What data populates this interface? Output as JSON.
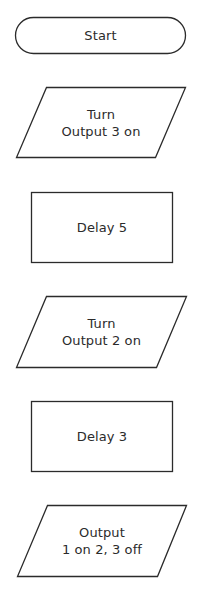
{
  "diagram": {
    "type": "flowchart",
    "stroke_color": "#2b2b2b",
    "text_color": "#2b2b2b",
    "background": "#ffffff",
    "nodes": [
      {
        "id": "start",
        "shape": "terminator",
        "lines": [
          "Start"
        ]
      },
      {
        "id": "turn-output-3-on",
        "shape": "parallelogram",
        "lines": [
          "Turn",
          "Output 3 on"
        ]
      },
      {
        "id": "delay-5",
        "shape": "rectangle",
        "lines": [
          "Delay 5"
        ]
      },
      {
        "id": "turn-output-2-on",
        "shape": "parallelogram",
        "lines": [
          "Turn",
          "Output 2 on"
        ]
      },
      {
        "id": "delay-3",
        "shape": "rectangle",
        "lines": [
          "Delay 3"
        ]
      },
      {
        "id": "output-1-on-2-3-off",
        "shape": "parallelogram",
        "lines": [
          "Output",
          "1 on 2, 3 off"
        ]
      }
    ]
  }
}
